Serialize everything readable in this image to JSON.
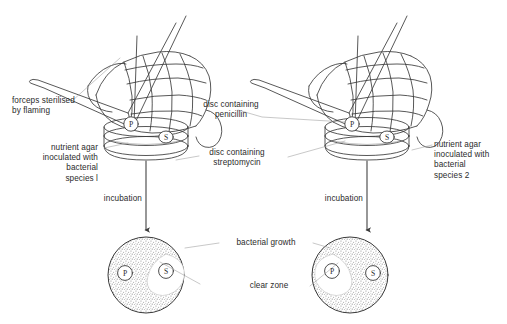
{
  "diagram": {
    "stroke_color": "#3a3a3a",
    "text_color": "#2b2b2b",
    "growth_color": "#8a8a8a",
    "background": "#ffffff"
  },
  "labels": {
    "forceps": "forceps sterilised\nby flaming",
    "agar_left": "nutrient agar\ninoculated with\nbacterial\nspecies l",
    "agar_right": "nutrient agar\ninoculated with\nbacterial\nspecies 2",
    "disc_penicillin": "disc containing\npenicillin",
    "disc_streptomycin": "disc containing\nstreptomycin",
    "incubation_left": "incubation",
    "incubation_right": "incubation",
    "bacterial_growth": "bacterial growth",
    "clear_zone": "clear zone"
  },
  "discs": {
    "penicillin_marker": "P",
    "streptomycin_marker": "S"
  },
  "results": {
    "left_dish": {
      "species": "species l",
      "clear_zone_around": "S",
      "growth_around": "P"
    },
    "right_dish": {
      "species": "species 2",
      "clear_zone_around": "P",
      "growth_around": "S"
    }
  }
}
